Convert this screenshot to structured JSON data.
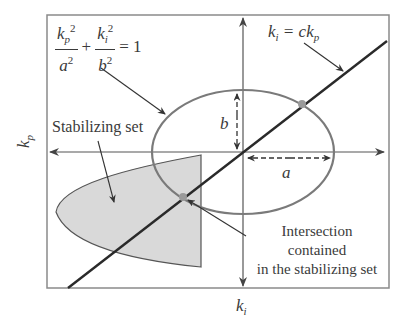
{
  "figure": {
    "ellipse_equation": {
      "term1_num": "k",
      "term1_num_sub": "p",
      "term1_num_sup": "2",
      "term1_den": "a",
      "term1_den_sup": "2",
      "plus": "+",
      "term2_num": "k",
      "term2_num_sub": "i",
      "term2_num_sup": "2",
      "term2_den": "b",
      "term2_den_sup": "2",
      "equals": "= 1"
    },
    "line_equation": {
      "lhs": "k",
      "lhs_sub": "i",
      "rhs": " = ck",
      "rhs_sub": "p"
    },
    "labels": {
      "stabilizing_set": "Stabilizing set",
      "semi_axis_a": "a",
      "semi_axis_b": "b",
      "intersection_note_line1": "Intersection",
      "intersection_note_line2": "contained",
      "intersection_note_line3": "in the stabilizing set"
    },
    "axes": {
      "x_label": "k",
      "x_label_sub": "i",
      "y_label": "k",
      "y_label_sub": "p"
    },
    "colors": {
      "frame": "#8a8a8a",
      "axis": "#555555",
      "ellipse": "#7a7a7a",
      "line": "#2a2a2a",
      "shaded_fill": "#d9d9d9",
      "shaded_stroke": "#555555",
      "intersection_dot": "#9a9a9a"
    }
  }
}
